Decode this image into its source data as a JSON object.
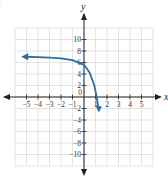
{
  "corner_label": "c",
  "chart_data": {
    "type": "line",
    "title": "",
    "xlabel": "x",
    "ylabel": "y",
    "xlim": [
      -6,
      6
    ],
    "ylim": [
      -12,
      12
    ],
    "grid": true,
    "x_ticks": [
      -5,
      -4,
      -3,
      -2,
      -1,
      1,
      2,
      3,
      4,
      5
    ],
    "x_tick_labels": [
      "−5",
      "−4",
      "−3",
      "−2",
      "−1",
      "1",
      "2",
      "3",
      "4",
      "5"
    ],
    "y_ticks": [
      10,
      8,
      6,
      4,
      2,
      -2,
      -4,
      -6,
      -8,
      -10
    ],
    "y_tick_labels": [
      "10",
      "8",
      "6",
      "4",
      "2",
      "−2",
      "−4",
      "−6",
      "−8",
      "−10"
    ],
    "origin_label": "0",
    "series": [
      {
        "name": "curve",
        "color": "#2e6e9e",
        "points": [
          [
            -5.2,
            7.0
          ],
          [
            -4,
            6.95
          ],
          [
            -3,
            6.85
          ],
          [
            -2,
            6.7
          ],
          [
            -1,
            6.4
          ],
          [
            0,
            5.6
          ],
          [
            0.5,
            4.2
          ],
          [
            0.9,
            2.0
          ],
          [
            1.1,
            0.0
          ],
          [
            1.25,
            -2.0
          ]
        ],
        "arrow_start": "left",
        "arrow_end": "down"
      }
    ],
    "axis_color": "#222222",
    "grid_color": "#d8d8d8"
  }
}
